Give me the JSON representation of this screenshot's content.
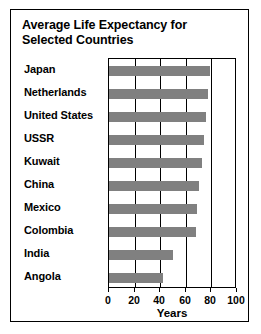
{
  "chart_data": {
    "type": "bar",
    "orientation": "horizontal",
    "title": "Average Life Expectancy for Selected Countries",
    "title_lines": [
      "Average Life Expectancy for",
      "Selected Countries"
    ],
    "xlabel": "Years",
    "ylabel": "",
    "categories": [
      "Japan",
      "Netherlands",
      "United States",
      "USSR",
      "Kuwait",
      "China",
      "Mexico",
      "Colombia",
      "India",
      "Angola"
    ],
    "values": [
      79,
      77,
      76,
      74,
      73,
      70,
      69,
      68,
      50,
      42
    ],
    "xlim": [
      0,
      100
    ],
    "xticks": [
      0,
      20,
      40,
      60,
      80,
      100
    ],
    "xtick_labels": [
      "0",
      "20",
      "40",
      "60",
      "80",
      "100"
    ],
    "grid": "vertical",
    "legend": null,
    "bar_color": "#808080",
    "frame_color": "#000000",
    "background": "#ffffff"
  }
}
